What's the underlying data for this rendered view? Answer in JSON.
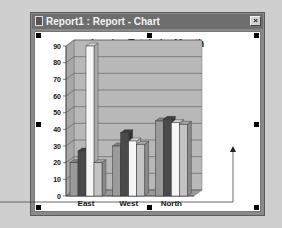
{
  "window": {
    "title": "Report1 : Report - Chart",
    "close_label": "×"
  },
  "chart_data": {
    "type": "bar",
    "title": "Invoice Totals by Month",
    "xlabel": "",
    "ylabel": "",
    "ylim": [
      0,
      90
    ],
    "yticks": [
      0,
      10,
      20,
      30,
      40,
      50,
      60,
      70,
      80,
      90
    ],
    "grid": true,
    "style": "3d-clustered",
    "categories": [
      "East",
      "West",
      "North"
    ],
    "series": [
      {
        "name": "Series 1",
        "values": [
          20,
          30,
          45
        ],
        "color": "#9a9a9a"
      },
      {
        "name": "Series 2",
        "values": [
          27,
          38,
          46
        ],
        "color": "#4a4a4a"
      },
      {
        "name": "Series 3",
        "values": [
          90,
          33,
          44
        ],
        "color": "#f6f6f6"
      },
      {
        "name": "Series 4",
        "values": [
          20,
          31,
          43
        ],
        "color": "#c4c4c4"
      }
    ],
    "legend": "none"
  },
  "colors": {
    "background": "#cfcfcf",
    "titlebar": "#6e6e6e",
    "plot_wall": "#b8b8b8"
  }
}
